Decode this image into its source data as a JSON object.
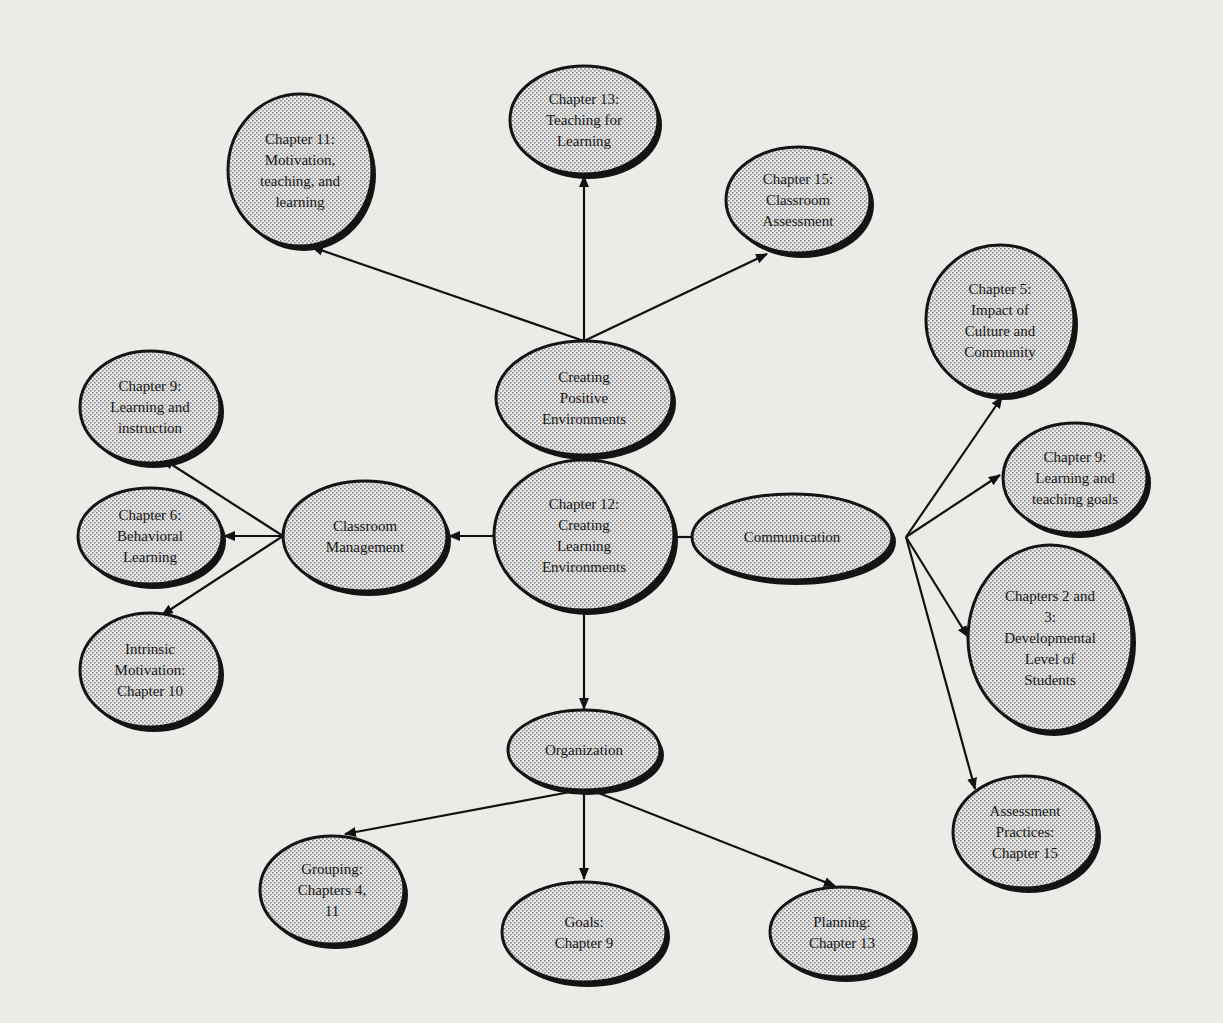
{
  "diagram": {
    "type": "concept-map",
    "colors": {
      "background": "#ecebe8",
      "node_fill_light": "#e6e6e6",
      "node_fill_dot": "#9a9a9a",
      "node_outline": "#141414",
      "edge": "#111111"
    },
    "nodes": [
      {
        "id": "ch12",
        "lines": [
          "Chapter 12:",
          "Creating",
          "Learning",
          "Environments"
        ],
        "cx": 584,
        "cy": 535,
        "rx": 90,
        "ry": 75
      },
      {
        "id": "cpe",
        "lines": [
          "Creating",
          "Positive",
          "Environments"
        ],
        "cx": 584,
        "cy": 398,
        "rx": 88,
        "ry": 57
      },
      {
        "id": "ch11",
        "lines": [
          "Chapter 11:",
          "Motivation,",
          "teaching, and",
          "learning"
        ],
        "cx": 300,
        "cy": 170,
        "rx": 72,
        "ry": 76
      },
      {
        "id": "ch13",
        "lines": [
          "Chapter 13:",
          "Teaching for",
          "Learning"
        ],
        "cx": 584,
        "cy": 120,
        "rx": 74,
        "ry": 54
      },
      {
        "id": "ch15",
        "lines": [
          "Chapter 15:",
          "Classroom",
          "Assessment"
        ],
        "cx": 798,
        "cy": 200,
        "rx": 72,
        "ry": 53
      },
      {
        "id": "cm",
        "lines": [
          "Classroom",
          "Management"
        ],
        "cx": 365,
        "cy": 536,
        "rx": 82,
        "ry": 55
      },
      {
        "id": "ch9li",
        "lines": [
          "Chapter 9:",
          "Learning and",
          "instruction"
        ],
        "cx": 150,
        "cy": 407,
        "rx": 70,
        "ry": 56
      },
      {
        "id": "ch6",
        "lines": [
          "Chapter 6:",
          "Behavioral",
          "Learning"
        ],
        "cx": 150,
        "cy": 536,
        "rx": 72,
        "ry": 48
      },
      {
        "id": "im",
        "lines": [
          "Intrinsic",
          "Motivation:",
          "Chapter 10"
        ],
        "cx": 150,
        "cy": 670,
        "rx": 70,
        "ry": 57
      },
      {
        "id": "comm",
        "lines": [
          "Communication"
        ],
        "cx": 792,
        "cy": 537,
        "rx": 100,
        "ry": 43
      },
      {
        "id": "ch5",
        "lines": [
          "Chapter 5:",
          "Impact of",
          "Culture and",
          "Community"
        ],
        "cx": 1000,
        "cy": 320,
        "rx": 74,
        "ry": 75
      },
      {
        "id": "ch9tg",
        "lines": [
          "Chapter  9:",
          "Learning and",
          "teaching goals"
        ],
        "cx": 1075,
        "cy": 478,
        "rx": 72,
        "ry": 55
      },
      {
        "id": "ch23",
        "lines": [
          "Chapters 2 and",
          "3:",
          "Developmental",
          "Level of",
          "Students"
        ],
        "cx": 1050,
        "cy": 638,
        "rx": 82,
        "ry": 93
      },
      {
        "id": "assess",
        "lines": [
          "Assessment",
          "Practices:",
          "Chapter 15"
        ],
        "cx": 1025,
        "cy": 832,
        "rx": 72,
        "ry": 56
      },
      {
        "id": "org",
        "lines": [
          "Organization"
        ],
        "cx": 584,
        "cy": 750,
        "rx": 76,
        "ry": 40
      },
      {
        "id": "grouping",
        "lines": [
          "Grouping:",
          "Chapters 4,",
          "11"
        ],
        "cx": 332,
        "cy": 890,
        "rx": 72,
        "ry": 54
      },
      {
        "id": "goals",
        "lines": [
          "Goals:",
          "Chapter 9"
        ],
        "cx": 584,
        "cy": 932,
        "rx": 82,
        "ry": 50
      },
      {
        "id": "planning",
        "lines": [
          "Planning:",
          "Chapter 13"
        ],
        "cx": 842,
        "cy": 932,
        "rx": 72,
        "ry": 45
      }
    ],
    "edges": [
      {
        "from": "ch12",
        "to": "cpe",
        "arrow": false,
        "x1": 584,
        "y1": 460,
        "x2": 584,
        "y2": 455
      },
      {
        "from": "cpe",
        "to": "ch11",
        "arrow": true,
        "x1": 584,
        "y1": 341,
        "x2": 312,
        "y2": 247
      },
      {
        "from": "cpe",
        "to": "ch13",
        "arrow": true,
        "x1": 584,
        "y1": 341,
        "x2": 584,
        "y2": 176
      },
      {
        "from": "cpe",
        "to": "ch15",
        "arrow": true,
        "x1": 584,
        "y1": 341,
        "x2": 767,
        "y2": 254
      },
      {
        "from": "ch12",
        "to": "cm",
        "arrow": true,
        "x1": 494,
        "y1": 536,
        "x2": 449,
        "y2": 536
      },
      {
        "from": "cm",
        "to": "ch9li",
        "arrow": true,
        "x1": 283,
        "y1": 536,
        "x2": 163,
        "y2": 459
      },
      {
        "from": "cm",
        "to": "ch6",
        "arrow": true,
        "x1": 283,
        "y1": 536,
        "x2": 224,
        "y2": 536
      },
      {
        "from": "cm",
        "to": "im",
        "arrow": true,
        "x1": 283,
        "y1": 536,
        "x2": 162,
        "y2": 615
      },
      {
        "from": "ch12",
        "to": "comm",
        "arrow": false,
        "x1": 674,
        "y1": 537,
        "x2": 692,
        "y2": 537
      },
      {
        "from": "comm",
        "to": "ch5",
        "arrow": true,
        "x1": 906,
        "y1": 537,
        "x2": 1002,
        "y2": 397
      },
      {
        "from": "comm",
        "to": "ch9tg",
        "arrow": true,
        "x1": 906,
        "y1": 537,
        "x2": 1000,
        "y2": 475
      },
      {
        "from": "comm",
        "to": "ch23",
        "arrow": true,
        "x1": 906,
        "y1": 537,
        "x2": 968,
        "y2": 637
      },
      {
        "from": "comm",
        "to": "assess",
        "arrow": true,
        "x1": 906,
        "y1": 537,
        "x2": 975,
        "y2": 789
      },
      {
        "from": "ch12",
        "to": "org",
        "arrow": true,
        "x1": 584,
        "y1": 610,
        "x2": 584,
        "y2": 709
      },
      {
        "from": "org",
        "to": "grouping",
        "arrow": true,
        "x1": 570,
        "y1": 792,
        "x2": 345,
        "y2": 834
      },
      {
        "from": "org",
        "to": "goals",
        "arrow": true,
        "x1": 584,
        "y1": 792,
        "x2": 584,
        "y2": 879
      },
      {
        "from": "org",
        "to": "planning",
        "arrow": true,
        "x1": 596,
        "y1": 792,
        "x2": 835,
        "y2": 886
      }
    ]
  }
}
